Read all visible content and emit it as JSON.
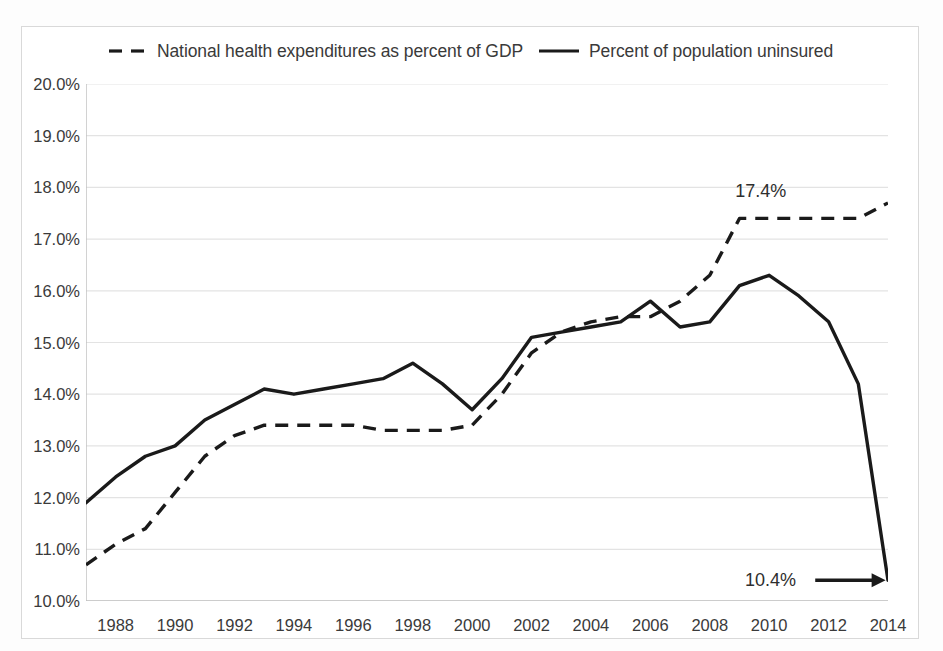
{
  "legend": {
    "position": "top-center",
    "entries": [
      {
        "label": "National health expenditures as percent of GDP",
        "style": "dashed",
        "icon": "dashed-line-swatch"
      },
      {
        "label": "Percent of population uninsured",
        "style": "solid",
        "icon": "solid-line-swatch"
      }
    ]
  },
  "annotations": [
    {
      "text": "17.4%",
      "series": "National health expenditures as percent of GDP",
      "year": 2010,
      "value": 17.4
    },
    {
      "text": "10.4%",
      "series": "Percent of population uninsured",
      "year": 2014,
      "value": 10.4,
      "arrow": "right-arrow"
    }
  ],
  "colors": {
    "line": "#1a1a1a",
    "grid": "#e3e3e3",
    "axis": "#bfbfbf",
    "text": "#3a3a3a",
    "frame": "#d9d9d9",
    "background": "#ffffff"
  },
  "chart_data": {
    "type": "line",
    "title": "",
    "subtitle": "",
    "xlabel": "",
    "ylabel": "",
    "grid": true,
    "legend_position": "top",
    "xlim": [
      1987,
      2014
    ],
    "ylim": [
      10.0,
      20.0
    ],
    "y_tick_labels": [
      "20.0%",
      "19.0%",
      "18.0%",
      "17.0%",
      "16.0%",
      "15.0%",
      "14.0%",
      "13.0%",
      "12.0%",
      "11.0%",
      "10.0%"
    ],
    "y_tick_values": [
      20.0,
      19.0,
      18.0,
      17.0,
      16.0,
      15.0,
      14.0,
      13.0,
      12.0,
      11.0,
      10.0
    ],
    "x_tick_labels": [
      "1988",
      "1990",
      "1992",
      "1994",
      "1996",
      "1998",
      "2000",
      "2002",
      "2004",
      "2006",
      "2008",
      "2010",
      "2012",
      "2014"
    ],
    "x_tick_values": [
      1988,
      1990,
      1992,
      1994,
      1996,
      1998,
      2000,
      2002,
      2004,
      2006,
      2008,
      2010,
      2012,
      2014
    ],
    "x": [
      1987,
      1988,
      1989,
      1990,
      1991,
      1992,
      1993,
      1994,
      1995,
      1996,
      1997,
      1998,
      1999,
      2000,
      2001,
      2002,
      2003,
      2004,
      2005,
      2006,
      2007,
      2008,
      2009,
      2010,
      2011,
      2012,
      2013,
      2014
    ],
    "series": [
      {
        "name": "National health expenditures as percent of GDP",
        "style": "dashed",
        "values": [
          10.7,
          11.1,
          11.4,
          12.1,
          12.8,
          13.2,
          13.4,
          13.4,
          13.4,
          13.4,
          13.3,
          13.3,
          13.3,
          13.4,
          14.0,
          14.8,
          15.2,
          15.4,
          15.5,
          15.5,
          15.8,
          16.3,
          17.4,
          17.4,
          17.4,
          17.4,
          17.4,
          17.7
        ]
      },
      {
        "name": "Percent of population uninsured",
        "style": "solid",
        "values": [
          11.9,
          12.4,
          12.8,
          13.0,
          13.5,
          13.8,
          14.1,
          14.0,
          14.1,
          14.2,
          14.3,
          14.6,
          14.2,
          13.7,
          14.3,
          15.1,
          15.2,
          15.3,
          15.4,
          15.8,
          15.3,
          15.4,
          16.1,
          16.3,
          15.9,
          15.4,
          14.2,
          10.4
        ]
      }
    ]
  }
}
